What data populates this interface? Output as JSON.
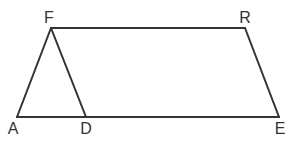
{
  "diagram": {
    "type": "geometry-figure",
    "points": [
      {
        "id": "F",
        "label": "F",
        "x": 51,
        "y": 28,
        "lx": 49,
        "ly": 23
      },
      {
        "id": "R",
        "label": "R",
        "x": 245,
        "y": 28,
        "lx": 245,
        "ly": 23
      },
      {
        "id": "A",
        "label": "A",
        "x": 17,
        "y": 117,
        "lx": 13,
        "ly": 134
      },
      {
        "id": "D",
        "label": "D",
        "x": 86,
        "y": 117,
        "lx": 86,
        "ly": 134
      },
      {
        "id": "E",
        "label": "E",
        "x": 279,
        "y": 117,
        "lx": 280,
        "ly": 134
      }
    ],
    "segments": [
      [
        "F",
        "R"
      ],
      [
        "R",
        "E"
      ],
      [
        "E",
        "A"
      ],
      [
        "A",
        "F"
      ],
      [
        "F",
        "D"
      ]
    ]
  }
}
